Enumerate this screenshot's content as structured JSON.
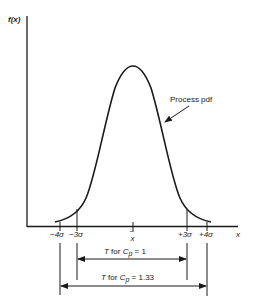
{
  "diagram": {
    "y_axis_label": "f(x)",
    "x_axis_label": "x",
    "curve_label": "Process pdf",
    "center_label": "x̄",
    "center_label_parts": {
      "bar": "–",
      "x": "x"
    },
    "ticks": [
      {
        "id": "minus4",
        "label": "−4σ"
      },
      {
        "id": "minus3",
        "label": "−3σ"
      },
      {
        "id": "plus3",
        "label": "+3σ"
      },
      {
        "id": "plus4",
        "label": "+4σ"
      }
    ],
    "spans": [
      {
        "id": "cp1",
        "label_prefix": "T",
        "label_mid": " for ",
        "label_sym": "C",
        "label_sub": "p",
        "label_value": " =  1",
        "from": "−3σ",
        "to": "+3σ"
      },
      {
        "id": "cp133",
        "label_prefix": "T",
        "label_mid": " for ",
        "label_sym": "C",
        "label_sub": "p",
        "label_value": " = 1.33",
        "from": "−4σ",
        "to": "+4σ"
      }
    ],
    "colors": {
      "ink": "#1a1a1a",
      "background": "#ffffff"
    }
  }
}
